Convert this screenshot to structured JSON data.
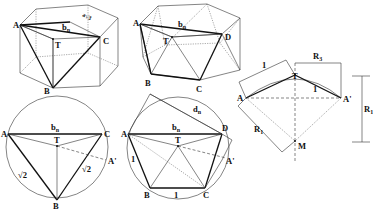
{
  "figure": {
    "panel1": {
      "name": "hexagonal prism with triangle ABC",
      "labels": {
        "A": "A",
        "B": "B",
        "C": "C",
        "T": "T",
        "bn": "b",
        "bn_sub": "n",
        "edge": "a√3"
      }
    },
    "panel2": {
      "name": "hexagonal antiprism with triangles",
      "labels": {
        "A": "A",
        "B": "B",
        "C": "C",
        "D": "D",
        "T": "T",
        "bn": "b",
        "bn_sub": "n"
      }
    },
    "panel3": {
      "name": "circle with triangle top view",
      "labels": {
        "A": "A",
        "B": "B",
        "C": "C",
        "T": "T",
        "Ap": "A'",
        "bn": "b",
        "bn_sub": "n",
        "sqrt2_left": "√2",
        "sqrt2_right": "√2"
      }
    },
    "panel4": {
      "name": "circle with pentagon top view",
      "labels": {
        "A": "A",
        "B": "B",
        "C": "C",
        "D": "D",
        "T": "T",
        "Ap": "A'",
        "bn": "b",
        "bn_sub": "n",
        "dn": "d",
        "dn_sub": "n",
        "one_left": "1",
        "one_bottom": "1"
      }
    },
    "panel5": {
      "name": "arc construction",
      "labels": {
        "A": "A",
        "Ap": "A'",
        "T": "T",
        "M": "M",
        "one_top": "1",
        "one_right": "1",
        "R3": "R",
        "R3_sub": "3",
        "R1_left": "R",
        "R1_left_sub": "1",
        "R1_right": "R",
        "R1_right_sub": "1"
      }
    }
  }
}
